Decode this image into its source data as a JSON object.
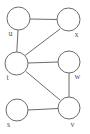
{
  "figure": {
    "kind": "undirected-graph-diagram",
    "width": 90,
    "height": 134,
    "background_color": "#ffffff",
    "stroke_color": "#6b6b6b",
    "node_fill_color": "#ffffff",
    "label_color": "#55555a"
  },
  "graph": {
    "node_count": 6,
    "edge_count": 7,
    "nodes": [
      {
        "id": "u",
        "label": "u",
        "cx": 18.5,
        "cy": 18.5,
        "r": 11.5,
        "label_x": 8.5,
        "label_y": 35.5
      },
      {
        "id": "x",
        "label": "x",
        "cx": 68.5,
        "cy": 19.5,
        "r": 11.5,
        "label_x": 74.5,
        "label_y": 36.5
      },
      {
        "id": "t",
        "label": "t",
        "cx": 16.5,
        "cy": 63.5,
        "r": 11.5,
        "label_x": 6.5,
        "label_y": 80.0
      },
      {
        "id": "w",
        "label": "w",
        "cx": 69.0,
        "cy": 62.0,
        "r": 11.0,
        "label_x": 74.5,
        "label_y": 78.5
      },
      {
        "id": "s",
        "label": "s",
        "cx": 17.0,
        "cy": 110.0,
        "r": 11.0,
        "label_x": 7.0,
        "label_y": 126.5
      },
      {
        "id": "v",
        "label": "v",
        "cx": 69.0,
        "cy": 108.0,
        "r": 11.0,
        "label_x": 70.5,
        "label_y": 126.5
      }
    ],
    "edges": [
      {
        "from": "u",
        "to": "x",
        "x1": 30.0,
        "y1": 19.0,
        "x2": 57.0,
        "y2": 19.5
      },
      {
        "from": "u",
        "to": "t",
        "x1": 18.0,
        "y1": 30.0,
        "x2": 16.8,
        "y2": 52.0
      },
      {
        "from": "t",
        "to": "x",
        "x1": 25.0,
        "y1": 55.5,
        "x2": 60.0,
        "y2": 29.0
      },
      {
        "from": "t",
        "to": "w",
        "x1": 28.0,
        "y1": 63.0,
        "x2": 58.0,
        "y2": 62.0
      },
      {
        "from": "t",
        "to": "v",
        "x1": 26.0,
        "y1": 71.5,
        "x2": 60.0,
        "y2": 100.0
      },
      {
        "from": "w",
        "to": "v",
        "x1": 69.0,
        "y1": 73.0,
        "x2": 69.0,
        "y2": 97.0
      },
      {
        "from": "s",
        "to": "v",
        "x1": 28.0,
        "y1": 110.0,
        "x2": 58.0,
        "y2": 108.5
      }
    ]
  }
}
